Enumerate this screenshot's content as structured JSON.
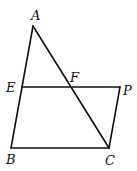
{
  "diagram": {
    "type": "geometry",
    "stroke_color": "#111111",
    "background": "#ffffff",
    "points": {
      "A": {
        "label": "A",
        "x": 33,
        "y": 26
      },
      "E": {
        "label": "E",
        "x": 22,
        "y": 87
      },
      "F": {
        "label": "F",
        "x": 69,
        "y": 87
      },
      "P": {
        "label": "P",
        "x": 120,
        "y": 87
      },
      "B": {
        "label": "B",
        "x": 11,
        "y": 148
      },
      "C": {
        "label": "C",
        "x": 109,
        "y": 148
      }
    },
    "segments": [
      "AB",
      "AC",
      "EP",
      "PC",
      "BC"
    ],
    "labels": {
      "A": "A",
      "E": "E",
      "F": "F",
      "P": "P",
      "B": "B",
      "C": "C"
    }
  }
}
